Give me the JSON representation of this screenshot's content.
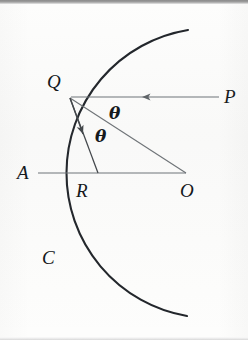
{
  "figure": {
    "type": "geometry-diagram",
    "background_color": "#fdfdfc",
    "ink_color": "#1b1f24",
    "line_color": "#6f7478",
    "labels": {
      "Q": "Q",
      "P": "P",
      "A": "A",
      "R": "R",
      "O": "O",
      "C": "C",
      "theta_upper": "θ",
      "theta_lower": "θ"
    },
    "points": {
      "Q": {
        "x": 70,
        "y": 98
      },
      "A": {
        "x": 41,
        "y": 173
      },
      "R": {
        "x": 98,
        "y": 173
      },
      "O": {
        "x": 186,
        "y": 173
      },
      "P_ray_start": {
        "x": 219,
        "y": 97
      },
      "P_ray_end": {
        "x": 70,
        "y": 97
      }
    },
    "arc": {
      "center_x": 186,
      "center_y": 173,
      "radius": 145,
      "start_x": 188,
      "start_y": 30,
      "end_x": 187,
      "end_y": 316
    },
    "segments": [
      {
        "name": "incident-ray-PQ",
        "from": "P",
        "to": "Q",
        "arrow": "mid-left"
      },
      {
        "name": "radius-QO",
        "from": "Q",
        "to": "O",
        "arrow": "none"
      },
      {
        "name": "reflected-ray-QR",
        "from": "Q",
        "to": "R",
        "arrow": "mid"
      },
      {
        "name": "axis-AO",
        "from": "A",
        "to": "O",
        "arrow": "none"
      }
    ],
    "angles": [
      {
        "name": "angle-of-incidence",
        "label": "θ",
        "x": 115,
        "y": 104
      },
      {
        "name": "angle-of-reflection",
        "label": "θ",
        "x": 100,
        "y": 136
      }
    ]
  },
  "page_bleed": {
    "ghost_line_1": "",
    "ghost_line_2": ""
  }
}
